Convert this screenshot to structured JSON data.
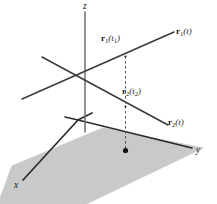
{
  "figure": {
    "type": "3d-coordinate-diagram",
    "background_color": "#ffffff",
    "plane_fill_color": "#c9c9c9",
    "plane_edge_color": "#b0b0b0",
    "line_color": "#3a3a3a",
    "axis_color": "#2b2b2b",
    "dashed_color": "#555555",
    "label_color": "#1a1a1a"
  },
  "axes": {
    "z": {
      "label": "z",
      "x": 83,
      "y": 3
    },
    "y": {
      "label": "y",
      "x": 196,
      "y": 147
    },
    "x": {
      "label": "x",
      "x": 14,
      "y": 182
    }
  },
  "curves": [
    {
      "name": "r1",
      "label_bold": "r",
      "label_sub": "1",
      "label_arg": "(t)",
      "label_x": 176,
      "label_y": 29
    },
    {
      "name": "r2",
      "label_bold": "r",
      "label_sub": "2",
      "label_arg": "(t)",
      "label_x": 168,
      "label_y": 120
    }
  ],
  "points": [
    {
      "name": "r1-at-t1",
      "label_bold": "r",
      "label_sub": "1",
      "label_arg": "(t",
      "label_arg_sub": "1",
      "label_arg_end": ")",
      "label_x": 101,
      "label_y": 36,
      "marker_x": 125.5,
      "marker_y": 56.5
    },
    {
      "name": "r2-at-t2",
      "label_bold": "r",
      "label_sub": "2",
      "label_arg": "(t",
      "label_arg_sub": "2",
      "label_arg_end": ")",
      "label_x": 122,
      "label_y": 89,
      "marker_x": 125.5,
      "marker_y": 106.5
    },
    {
      "name": "plane-projection-point",
      "marker_x": 125.5,
      "marker_y": 150.5
    }
  ]
}
